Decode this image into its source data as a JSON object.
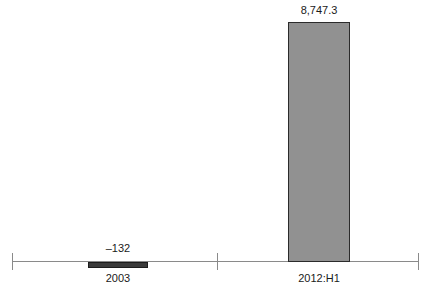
{
  "chart_data": {
    "type": "bar",
    "title": "",
    "subtitle": "",
    "xlabel": "",
    "ylabel": "",
    "categories": [
      "2003",
      "2012:H1"
    ],
    "values": [
      -132,
      8747.3
    ],
    "data_labels": [
      "–132",
      "8,747.3"
    ],
    "series": [
      {
        "name": "",
        "values": [
          -132,
          8747.3
        ]
      }
    ],
    "ylim": [
      -132,
      8747.3
    ],
    "grid": false,
    "legend": "none",
    "axis": {
      "orientation": "horizontal",
      "tick_count": 3,
      "show_y_axis": false
    },
    "colors": {
      "positive_bar_fill": "#919191",
      "positive_bar_border": "#2b2b2b",
      "negative_bar_fill": "#3a3a3a",
      "negative_bar_border": "#1c1c1c",
      "axis": "#8a8a8a",
      "text": "#1a1a1a",
      "background": "#ffffff"
    }
  }
}
